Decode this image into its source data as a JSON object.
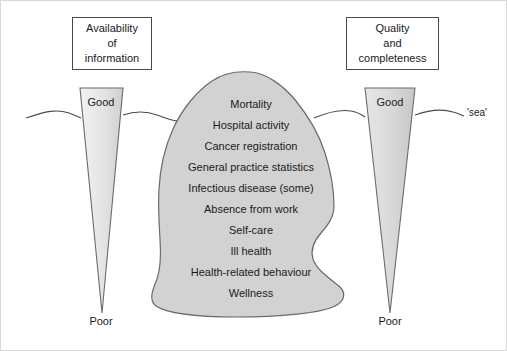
{
  "left_axis": {
    "title_lines": [
      "Availability",
      "of",
      "information"
    ],
    "top_label": "Good",
    "bottom_label": "Poor"
  },
  "right_axis": {
    "title_lines": [
      "Quality",
      "and",
      "completeness"
    ],
    "top_label": "Good",
    "bottom_label": "Poor"
  },
  "sea": {
    "label": "'sea'"
  },
  "iceberg": {
    "items": [
      "Mortality",
      "Hospital activity",
      "Cancer registration",
      "General practice statistics",
      "Infectious disease (some)",
      "Absence from work",
      "Self-care",
      "Ill health",
      "Health-related behaviour",
      "Wellness"
    ]
  },
  "colors": {
    "iceberg_fill": "#d2d2d2",
    "iceberg_stroke": "#6b6b6b",
    "triangle_fill_light": "#ececec",
    "triangle_fill_dark": "#c9c9c9",
    "triangle_stroke": "#6b6b6b",
    "sea_line": "#4a4a4a",
    "text": "#1a1a1a",
    "box_border": "#4a4a4a",
    "page_border": "#d8d8d8",
    "background": "#ffffff"
  }
}
